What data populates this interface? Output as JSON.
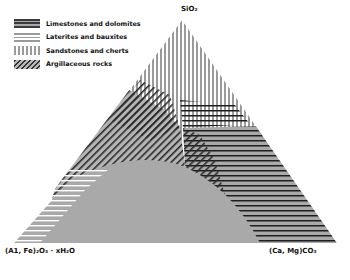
{
  "diagram": {
    "type": "ternary-field-diagram",
    "vertices": {
      "top": "SiO₂",
      "left": "(A1, Fe)₂O₃ · xH₂O",
      "right": "(Ca, Mg)CO₃"
    },
    "legend": [
      {
        "pattern": "dense-horizontal-lines",
        "label": "Limestones and dolomites"
      },
      {
        "pattern": "light-horizontal-lines",
        "label": "Laterites and bauxites"
      },
      {
        "pattern": "vertical-lines",
        "label": "Sandstones and cherts"
      },
      {
        "pattern": "diagonal-lines",
        "label": "Argillaceous rocks"
      }
    ],
    "fields": [
      {
        "name": "Sandstones and cherts",
        "region": "upper apex"
      },
      {
        "name": "Argillaceous rocks",
        "region": "central-left band"
      },
      {
        "name": "Limestones and dolomites",
        "region": "right side toward (Ca,Mg)CO₃"
      },
      {
        "name": "Laterites and bauxites",
        "region": "lower-left toward (A1,Fe)₂O₃·xH₂O"
      }
    ],
    "colors": {
      "fill_gray": "#a9a9a9",
      "hatch_dark": "#222222",
      "hatch_light": "#9a9a9a"
    }
  }
}
